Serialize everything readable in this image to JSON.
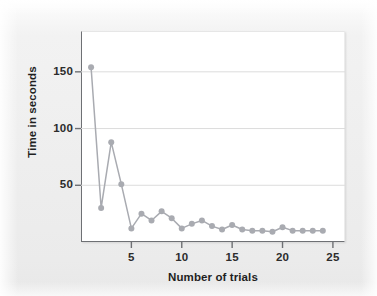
{
  "figure": {
    "background_color": "#eeeeee",
    "plot_background_color": "#ffffff",
    "axis_color": "#6e7074",
    "gridline_color": "#dcdcdc",
    "series_color": "#a9abb1",
    "text_color": "#1f1f1f"
  },
  "chart_data": {
    "type": "line",
    "title": "",
    "xlabel": "Number of trials",
    "ylabel": "Time in seconds",
    "xlim": [
      0,
      26.2
    ],
    "ylim": [
      0,
      186
    ],
    "xticks": [
      5,
      10,
      15,
      20,
      25
    ],
    "yticks": [
      50,
      100,
      150
    ],
    "xtick_labels": [
      "5",
      "10",
      "15",
      "20",
      "25"
    ],
    "ytick_labels": [
      "50",
      "100",
      "150"
    ],
    "grid": "horizontal",
    "legend": "none",
    "markers": true,
    "marker_shape": "circle",
    "x": [
      1,
      2,
      3,
      4,
      5,
      6,
      7,
      8,
      9,
      10,
      11,
      12,
      13,
      14,
      15,
      16,
      17,
      18,
      19,
      20,
      21,
      22,
      23,
      24
    ],
    "values": [
      154,
      30,
      88,
      51,
      12,
      25,
      19,
      27,
      21,
      12,
      16,
      19,
      14,
      11,
      15,
      11,
      10,
      10,
      9,
      13,
      10,
      10,
      10,
      10
    ],
    "series": [
      {
        "name": "Time in seconds",
        "values": [
          154,
          30,
          88,
          51,
          12,
          25,
          19,
          27,
          21,
          12,
          16,
          19,
          14,
          11,
          15,
          11,
          10,
          10,
          9,
          13,
          10,
          10,
          10,
          10
        ]
      }
    ]
  }
}
